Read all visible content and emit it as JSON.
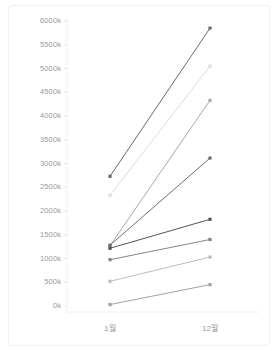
{
  "chart_data": {
    "type": "line",
    "title": "",
    "subtitle": "",
    "xlabel": "",
    "ylabel": "",
    "categories": [
      "1월",
      "12월"
    ],
    "x": [
      0,
      1
    ],
    "ylim": [
      0,
      6000
    ],
    "xlim": [
      -0.35,
      1.35
    ],
    "ytick_labels": [
      "0k",
      "500k",
      "1000k",
      "1500k",
      "2000k",
      "2500k",
      "3000k",
      "3500k",
      "4000k",
      "4500k",
      "5000k",
      "5500k",
      "6000k"
    ],
    "ytick_values": [
      0,
      500,
      1000,
      1500,
      2000,
      2500,
      3000,
      3500,
      4000,
      4500,
      5000,
      5500,
      6000
    ],
    "yunit": "k",
    "grid": false,
    "legend": "none",
    "axis_line_color": "#e8e8e8",
    "tick_text_color": "#9b9b9b",
    "marker": "square",
    "series": [
      {
        "name": "series-1",
        "values": [
          2730,
          5850
        ],
        "color": "#6b6b6b"
      },
      {
        "name": "series-2",
        "values": [
          2330,
          5050
        ],
        "color": "#dcdcdc"
      },
      {
        "name": "series-3",
        "values": [
          1270,
          4330
        ],
        "color": "#a8a8a8"
      },
      {
        "name": "series-4",
        "values": [
          1280,
          3115
        ],
        "color": "#6e6e6e"
      },
      {
        "name": "series-5",
        "values": [
          1215,
          1825
        ],
        "color": "#555555"
      },
      {
        "name": "series-6",
        "values": [
          975,
          1400
        ],
        "color": "#848484"
      },
      {
        "name": "series-7",
        "values": [
          520,
          1030
        ],
        "color": "#bdbdbd"
      },
      {
        "name": "series-8",
        "values": [
          30,
          450
        ],
        "color": "#a0a0a0"
      }
    ]
  }
}
